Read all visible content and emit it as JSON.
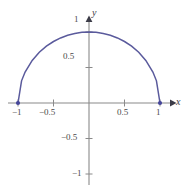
{
  "figure": {
    "title": "",
    "x_axis_label": "x",
    "y_axis_label": "y",
    "curve_color": "#5a5a9c",
    "axis_color": "#8a8a8a",
    "label_color": "#4a4a4a",
    "background_color": "#ffffff"
  },
  "ticks": {
    "x": [
      {
        "value": -1,
        "label": "−1"
      },
      {
        "value": -0.5,
        "label": "−0.5"
      },
      {
        "value": 0.5,
        "label": "0.5"
      },
      {
        "value": 1,
        "label": "1"
      }
    ],
    "y": [
      {
        "value": 1,
        "label": "1"
      },
      {
        "value": 0.5,
        "label": "0.5"
      },
      {
        "value": -0.5,
        "label": "−0.5"
      },
      {
        "value": -1,
        "label": "−1"
      }
    ]
  },
  "chart_data": {
    "type": "line",
    "title": "",
    "xlabel": "x",
    "ylabel": "y",
    "xlim": [
      -1.15,
      1.35
    ],
    "ylim": [
      -1.4,
      1.25
    ],
    "grid": false,
    "legend": null,
    "series": [
      {
        "name": "upper unit semicircle",
        "equation": "y = sqrt(1 - x^2)",
        "color": "#5a5a9c",
        "x": [
          -1,
          -0.95,
          -0.9,
          -0.8,
          -0.7,
          -0.6,
          -0.5,
          -0.4,
          -0.3,
          -0.2,
          -0.1,
          0,
          0.1,
          0.2,
          0.3,
          0.4,
          0.5,
          0.6,
          0.7,
          0.8,
          0.9,
          0.95,
          1
        ],
        "y": [
          0,
          0.3122,
          0.4359,
          0.6,
          0.7141,
          0.8,
          0.866,
          0.9165,
          0.9539,
          0.9798,
          0.995,
          1,
          0.995,
          0.9798,
          0.9539,
          0.9165,
          0.866,
          0.8,
          0.7141,
          0.6,
          0.4359,
          0.3122,
          0
        ]
      }
    ],
    "points": [
      {
        "x": -1,
        "y": 0,
        "style": "filled",
        "color": "#45459a"
      },
      {
        "x": 1,
        "y": 0,
        "style": "filled",
        "color": "#45459a"
      }
    ],
    "x_ticks": [
      -1,
      -0.5,
      0.5,
      1
    ],
    "y_ticks": [
      -1,
      -0.5,
      0.5,
      1
    ],
    "x_tick_labels": [
      "−1",
      "−0.5",
      "0.5",
      "1"
    ],
    "y_tick_labels": [
      "−1",
      "−0.5",
      "0.5",
      "1"
    ]
  }
}
